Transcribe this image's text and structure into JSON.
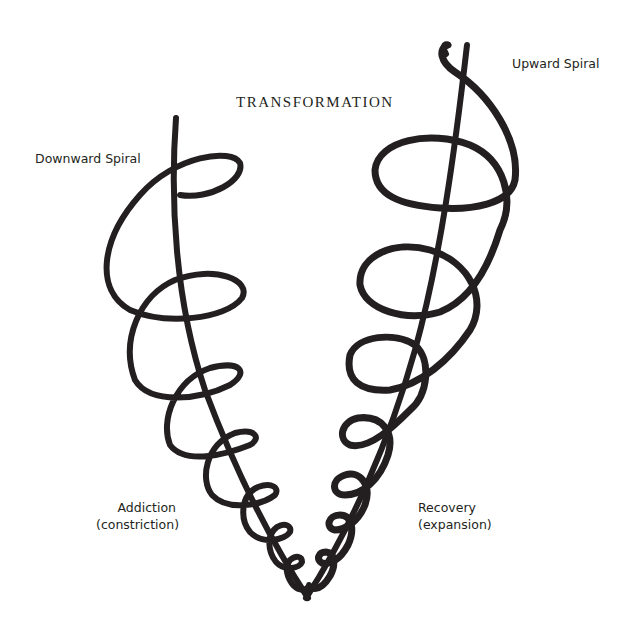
{
  "diagram": {
    "title": "TRANSFORMATION",
    "labels": {
      "downward": "Downward Spiral",
      "upward": "Upward Spiral",
      "addiction_line1": "Addiction",
      "addiction_line2": "(constriction)",
      "recovery_line1": "Recovery",
      "recovery_line2": "(expansion)"
    },
    "colors": {
      "ink": "#231f20",
      "background": "#ffffff"
    },
    "spirals": [
      {
        "name": "downward-spiral",
        "axis": {
          "x1": 176,
          "y1": 118,
          "x2": 310,
          "y2": 598
        },
        "loops": [
          {
            "cx": 172,
            "cy": 255,
            "rx": 72,
            "ry": 80
          },
          {
            "cx": 190,
            "cy": 320,
            "rx": 58,
            "ry": 52
          },
          {
            "cx": 205,
            "cy": 385,
            "rx": 48,
            "ry": 42
          },
          {
            "cx": 222,
            "cy": 440,
            "rx": 38,
            "ry": 33
          },
          {
            "cx": 242,
            "cy": 492,
            "rx": 30,
            "ry": 26
          },
          {
            "cx": 262,
            "cy": 535,
            "rx": 22,
            "ry": 19
          },
          {
            "cx": 280,
            "cy": 567,
            "rx": 15,
            "ry": 13
          },
          {
            "cx": 295,
            "cy": 586,
            "rx": 9,
            "ry": 8
          }
        ]
      },
      {
        "name": "upward-spiral",
        "axis": {
          "x1": 467,
          "y1": 45,
          "x2": 305,
          "y2": 598
        },
        "loops": [
          {
            "cx": 450,
            "cy": 170,
            "rx": 72,
            "ry": 40
          },
          {
            "cx": 425,
            "cy": 275,
            "rx": 62,
            "ry": 50
          },
          {
            "cx": 392,
            "cy": 370,
            "rx": 44,
            "ry": 40
          },
          {
            "cx": 373,
            "cy": 440,
            "rx": 34,
            "ry": 30
          },
          {
            "cx": 355,
            "cy": 492,
            "rx": 26,
            "ry": 22
          },
          {
            "cx": 340,
            "cy": 533,
            "rx": 19,
            "ry": 17
          },
          {
            "cx": 326,
            "cy": 565,
            "rx": 13,
            "ry": 11
          },
          {
            "cx": 315,
            "cy": 585,
            "rx": 8,
            "ry": 7
          }
        ]
      }
    ]
  }
}
